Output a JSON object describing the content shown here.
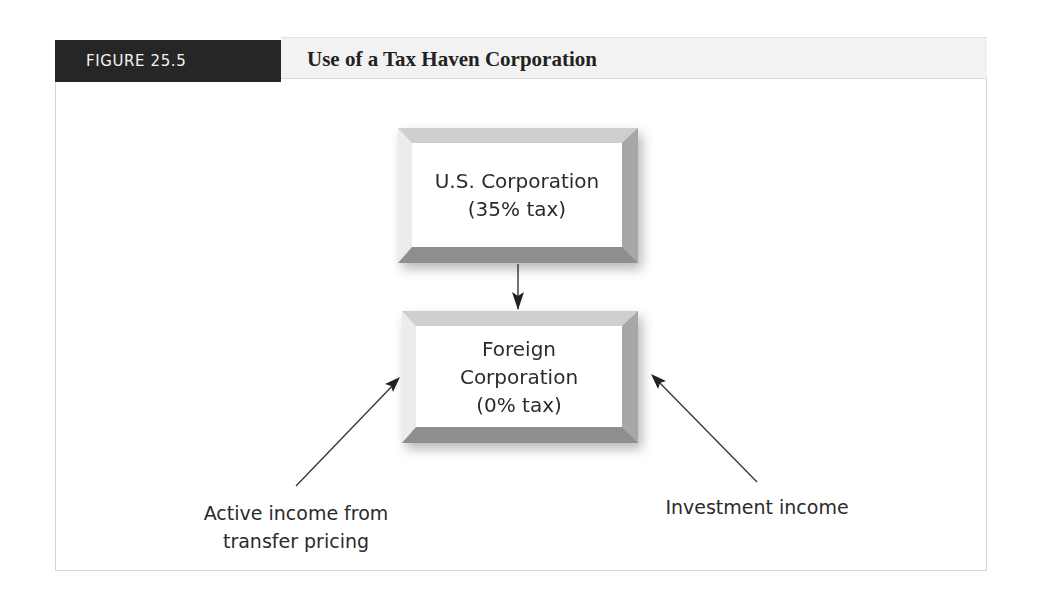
{
  "figure": {
    "number_label": "FIGURE 25.5",
    "title": "Use of a Tax Haven Corporation"
  },
  "diagram": {
    "nodes": [
      {
        "id": "us-corporation",
        "lines": [
          "U.S. Corporation",
          "(35% tax)"
        ]
      },
      {
        "id": "foreign-corporation",
        "lines": [
          "Foreign",
          "Corporation",
          "(0% tax)"
        ]
      }
    ],
    "edges": [
      {
        "from": "us-corporation",
        "to": "foreign-corporation"
      },
      {
        "from": "active-income",
        "to": "foreign-corporation"
      },
      {
        "from": "investment-income",
        "to": "foreign-corporation"
      }
    ],
    "inputs": [
      {
        "id": "active-income",
        "lines": [
          "Active income from",
          "transfer pricing"
        ]
      },
      {
        "id": "investment-income",
        "lines": [
          "Investment income"
        ]
      }
    ]
  },
  "colors": {
    "label_bg": "#262626",
    "title_bar_bg": "#f2f2f2",
    "text": "#2b2b2b",
    "bevel_top": "#cfcfcf",
    "bevel_right": "#a7a7a7",
    "bevel_bottom": "#8e8e8e",
    "bevel_left": "#ececec"
  }
}
